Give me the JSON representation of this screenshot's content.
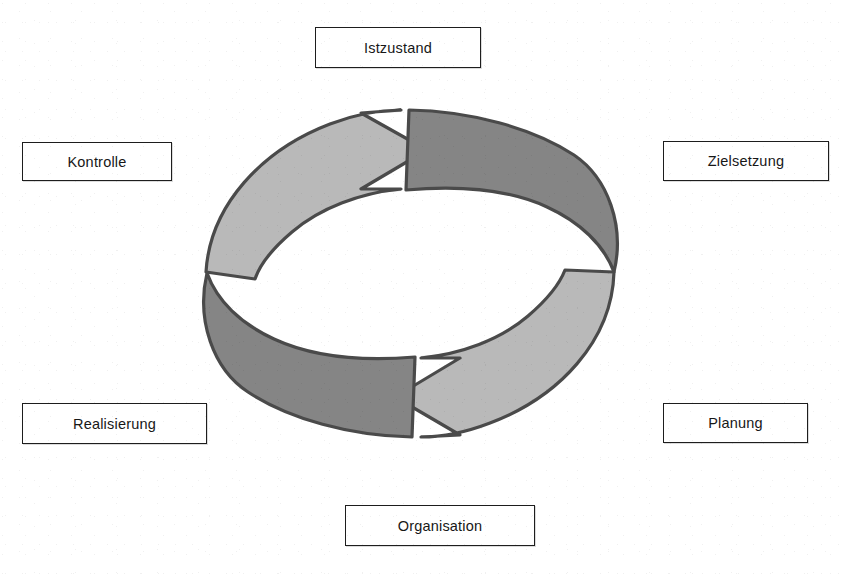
{
  "diagram": {
    "colors": {
      "arrow_light": "#b9b9b9",
      "arrow_dark": "#858585",
      "outline": "#4a4a4a",
      "box_border": "#1d1d1d",
      "box_fill": "#ffffff",
      "text": "#171717",
      "background": "#ffffff"
    },
    "cycle": {
      "shape": "ellipse-ring",
      "direction": "clockwise",
      "arrow_count": 2,
      "arrows": [
        {
          "name": "upper-arrow",
          "points_to": "right",
          "head_position": "top-center-right"
        },
        {
          "name": "lower-arrow",
          "points_to": "left",
          "head_position": "bottom-center-left"
        }
      ]
    },
    "labels": [
      {
        "id": "istzustand",
        "text": "Istzustand",
        "position": "top"
      },
      {
        "id": "zielsetzung",
        "text": "Zielsetzung",
        "position": "right-upper"
      },
      {
        "id": "planung",
        "text": "Planung",
        "position": "right-lower"
      },
      {
        "id": "organisation",
        "text": "Organisation",
        "position": "bottom"
      },
      {
        "id": "realisierung",
        "text": "Realisierung",
        "position": "left-lower"
      },
      {
        "id": "kontrolle",
        "text": "Kontrolle",
        "position": "left-upper"
      }
    ]
  }
}
